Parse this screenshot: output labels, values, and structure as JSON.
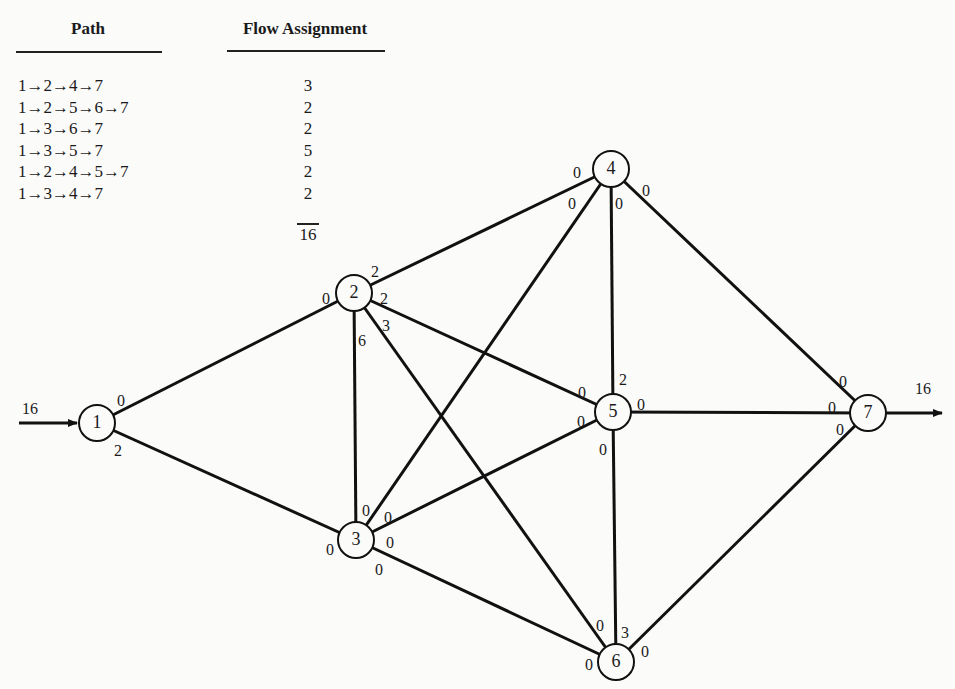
{
  "table": {
    "headers": {
      "path": "Path",
      "flow": "Flow Assignment"
    },
    "rows": [
      {
        "path": "1→2→4→7",
        "flow": "3"
      },
      {
        "path": "1→2→5→6→7",
        "flow": "2"
      },
      {
        "path": "1→3→6→7",
        "flow": "2"
      },
      {
        "path": "1→3→5→7",
        "flow": "5"
      },
      {
        "path": "1→2→4→5→7",
        "flow": "2"
      },
      {
        "path": "1→3→4→7",
        "flow": "2"
      }
    ],
    "total": "16"
  },
  "network": {
    "source_flow": "16",
    "sink_flow": "16",
    "nodes": [
      {
        "id": "1",
        "x": 97,
        "y": 423
      },
      {
        "id": "2",
        "x": 354,
        "y": 293
      },
      {
        "id": "3",
        "x": 356,
        "y": 540
      },
      {
        "id": "4",
        "x": 611,
        "y": 169
      },
      {
        "id": "5",
        "x": 613,
        "y": 412
      },
      {
        "id": "6",
        "x": 616,
        "y": 662
      },
      {
        "id": "7",
        "x": 868,
        "y": 413
      }
    ],
    "edges": [
      {
        "from": "1",
        "to": "2"
      },
      {
        "from": "1",
        "to": "3"
      },
      {
        "from": "2",
        "to": "4"
      },
      {
        "from": "2",
        "to": "5"
      },
      {
        "from": "2",
        "to": "6"
      },
      {
        "from": "2",
        "to": "3"
      },
      {
        "from": "3",
        "to": "4"
      },
      {
        "from": "3",
        "to": "5"
      },
      {
        "from": "3",
        "to": "6"
      },
      {
        "from": "4",
        "to": "5"
      },
      {
        "from": "4",
        "to": "7"
      },
      {
        "from": "5",
        "to": "7"
      },
      {
        "from": "5",
        "to": "6"
      },
      {
        "from": "6",
        "to": "7"
      }
    ],
    "edge_labels": [
      {
        "text": "0",
        "x": 121,
        "y": 402,
        "note": "node1 end of 1-2"
      },
      {
        "text": "2",
        "x": 118,
        "y": 452,
        "note": "node1 end of 1-3"
      },
      {
        "text": "0",
        "x": 326,
        "y": 300,
        "note": "node2 end of 1-2"
      },
      {
        "text": "2",
        "x": 375,
        "y": 273,
        "note": "node2 end of 2-4"
      },
      {
        "text": "2",
        "x": 384,
        "y": 300,
        "note": "node2 end of 2-5"
      },
      {
        "text": "3",
        "x": 386,
        "y": 327,
        "note": "node2 end of 2-6"
      },
      {
        "text": "6",
        "x": 362,
        "y": 342,
        "note": "node2 end of 2-3"
      },
      {
        "text": "0",
        "x": 330,
        "y": 551,
        "note": "node3 end of 1-3"
      },
      {
        "text": "0",
        "x": 366,
        "y": 512,
        "note": "node3 end of 2-3"
      },
      {
        "text": "0",
        "x": 388,
        "y": 519,
        "note": "node3 end of 3-4"
      },
      {
        "text": "0",
        "x": 390,
        "y": 544,
        "note": "node3 end of 3-5"
      },
      {
        "text": "0",
        "x": 379,
        "y": 571,
        "note": "node3 end of 3-6"
      },
      {
        "text": "0",
        "x": 577,
        "y": 174,
        "note": "node4 end of 2-4"
      },
      {
        "text": "0",
        "x": 572,
        "y": 205,
        "note": "node4 end of 3-4"
      },
      {
        "text": "0",
        "x": 619,
        "y": 205,
        "note": "node4 end of 4-5"
      },
      {
        "text": "0",
        "x": 646,
        "y": 192,
        "note": "node4 end of 4-7"
      },
      {
        "text": "2",
        "x": 623,
        "y": 381,
        "note": "node5 end of 4-5"
      },
      {
        "text": "0",
        "x": 582,
        "y": 394,
        "note": "node5 end of 2-5"
      },
      {
        "text": "0",
        "x": 581,
        "y": 423,
        "note": "node5 end of 3-5"
      },
      {
        "text": "0",
        "x": 641,
        "y": 406,
        "note": "node5 end of 5-7"
      },
      {
        "text": "0",
        "x": 603,
        "y": 451,
        "note": "node5 end of 5-6"
      },
      {
        "text": "0",
        "x": 600,
        "y": 627,
        "note": "node6 end of 2-6"
      },
      {
        "text": "3",
        "x": 625,
        "y": 634,
        "note": "node6 end of 5-6"
      },
      {
        "text": "0",
        "x": 589,
        "y": 666,
        "note": "node6 end of 3-6"
      },
      {
        "text": "0",
        "x": 645,
        "y": 653,
        "note": "node6 end of 6-7"
      },
      {
        "text": "0",
        "x": 843,
        "y": 383,
        "note": "node7 end of 4-7"
      },
      {
        "text": "0",
        "x": 832,
        "y": 409,
        "note": "node7 end of 5-7"
      },
      {
        "text": "0",
        "x": 840,
        "y": 431,
        "note": "node7 end of 6-7"
      }
    ]
  }
}
